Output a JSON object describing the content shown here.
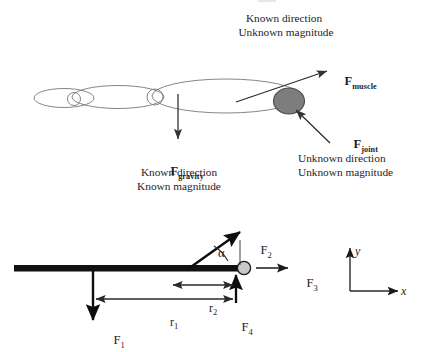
{
  "diagram": {
    "top_panel": {
      "muscle_note": {
        "line1": "Known direction",
        "line2": "Unknown magnitude"
      },
      "muscle_label": {
        "symbol": "F",
        "subscript": "muscle"
      },
      "gravity_label": {
        "symbol": "F",
        "subscript": "gravity"
      },
      "gravity_note": {
        "line1": "Known direction",
        "line2": "Known magnitude"
      },
      "joint_label": {
        "symbol": "F",
        "subscript": "joint"
      },
      "joint_note": {
        "line1": "Unknown direction",
        "line2": "Unknown magnitude"
      }
    },
    "bottom_panel": {
      "force_1": {
        "symbol": "F",
        "subscript": "1"
      },
      "force_2": {
        "symbol": "F",
        "subscript": "2"
      },
      "force_3": {
        "symbol": "F",
        "subscript": "3"
      },
      "force_4": {
        "symbol": "F",
        "subscript": "4"
      },
      "angle_label": "α",
      "distance_1": {
        "symbol": "r",
        "subscript": "1"
      },
      "distance_2": {
        "symbol": "r",
        "subscript": "2"
      },
      "axis_x": "x",
      "axis_y": "y"
    },
    "colors": {
      "ink": "#1d1d1d",
      "outline": "#6f6f6f",
      "joint_fill": "#7d7d7d",
      "joint_stroke": "#4a4a4a",
      "ball_fill": "#c9c9c9",
      "ball_stroke": "#1a1a1a",
      "bar": "#111111",
      "arrow": "#1a1a1a",
      "dim_arrow": "#2a2a2a"
    }
  }
}
